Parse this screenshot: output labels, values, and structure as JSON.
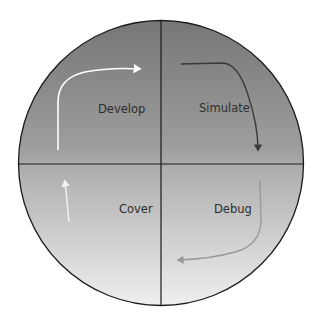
{
  "diagram": {
    "type": "cycle",
    "shape": "circle-divided-into-quadrants",
    "colors": {
      "background": "#ffffff",
      "fill_top": "#7b7b7b",
      "fill_middle": "#a9a9a9",
      "fill_bottom": "#ebebeb",
      "outline": "#1a1a1a",
      "label": "#2e2e2e",
      "arrow_develop": "#ffffff",
      "arrow_simulate": "#3a3a3a",
      "arrow_debug": "#9a9a9a",
      "arrow_cover": "#f4f4f4"
    },
    "quadrants": [
      {
        "position": "top-left",
        "label": "Develop",
        "arrow_direction": "up then right"
      },
      {
        "position": "top-right",
        "label": "Simulate",
        "arrow_direction": "right then down"
      },
      {
        "position": "bottom-right",
        "label": "Debug",
        "arrow_direction": "down then left"
      },
      {
        "position": "bottom-left",
        "label": "Cover",
        "arrow_direction": "up"
      }
    ],
    "cycle_order": [
      "Develop",
      "Simulate",
      "Debug",
      "Cover"
    ]
  }
}
